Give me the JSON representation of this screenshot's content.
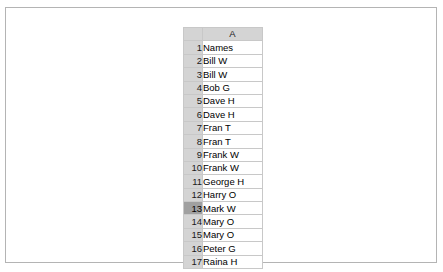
{
  "spreadsheet": {
    "corner_label": "",
    "column_headers": [
      "A"
    ],
    "rows": [
      {
        "number": "1",
        "selected": false,
        "bold": true,
        "cells": [
          "Names"
        ]
      },
      {
        "number": "2",
        "selected": false,
        "bold": false,
        "cells": [
          "Bill W"
        ]
      },
      {
        "number": "3",
        "selected": false,
        "bold": false,
        "cells": [
          "Bill W"
        ]
      },
      {
        "number": "4",
        "selected": false,
        "bold": false,
        "cells": [
          "Bob G"
        ]
      },
      {
        "number": "5",
        "selected": false,
        "bold": false,
        "cells": [
          "Dave H"
        ]
      },
      {
        "number": "6",
        "selected": false,
        "bold": false,
        "cells": [
          "Dave H"
        ]
      },
      {
        "number": "7",
        "selected": false,
        "bold": false,
        "cells": [
          "Fran T"
        ]
      },
      {
        "number": "8",
        "selected": false,
        "bold": false,
        "cells": [
          "Fran T"
        ]
      },
      {
        "number": "9",
        "selected": false,
        "bold": false,
        "cells": [
          "Frank W"
        ]
      },
      {
        "number": "10",
        "selected": false,
        "bold": false,
        "cells": [
          "Frank W"
        ]
      },
      {
        "number": "11",
        "selected": false,
        "bold": false,
        "cells": [
          "George H"
        ]
      },
      {
        "number": "12",
        "selected": false,
        "bold": false,
        "cells": [
          "Harry O"
        ]
      },
      {
        "number": "13",
        "selected": true,
        "bold": false,
        "cells": [
          "Mark W"
        ]
      },
      {
        "number": "14",
        "selected": false,
        "bold": false,
        "cells": [
          "Mary O"
        ]
      },
      {
        "number": "15",
        "selected": false,
        "bold": false,
        "cells": [
          "Mary O"
        ]
      },
      {
        "number": "16",
        "selected": false,
        "bold": false,
        "cells": [
          "Peter G"
        ]
      },
      {
        "number": "17",
        "selected": false,
        "bold": false,
        "cells": [
          "Raina H"
        ]
      }
    ]
  },
  "colors": {
    "header_grey": "#d4d4d4",
    "selected_row_grey": "#a0a0a0",
    "gridline": "#c8c8c8",
    "header_border": "#9a9a9a",
    "frame_border": "#b4b4b4",
    "cell_background": "#ffffff",
    "text": "#000000"
  }
}
